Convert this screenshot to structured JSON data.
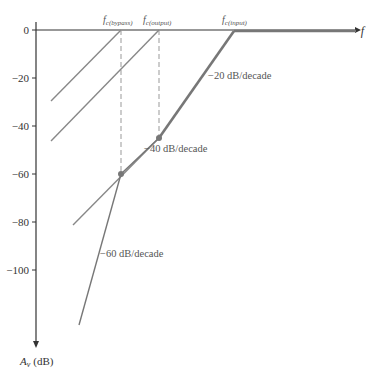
{
  "figure": {
    "x_axis_label": "f",
    "y_axis_label": "A",
    "y_axis_label_sub": "v",
    "y_axis_unit": "(dB)",
    "y_ticks": [
      "0",
      "−20",
      "−40",
      "−60",
      "−80",
      "−100"
    ],
    "critical_frequencies": [
      {
        "label": "f",
        "sub": "c(bypass)"
      },
      {
        "label": "f",
        "sub": "c(output)"
      },
      {
        "label": "f",
        "sub": "c(input)"
      }
    ],
    "annotations": {
      "slope20": "−20 dB/decade",
      "slope40": "−40 dB/decade",
      "slope60": "−60 dB/decade"
    },
    "colors": {
      "axis": "#333333",
      "response": "#777777",
      "asymptote": "#888888",
      "dashed": "#999999"
    }
  }
}
